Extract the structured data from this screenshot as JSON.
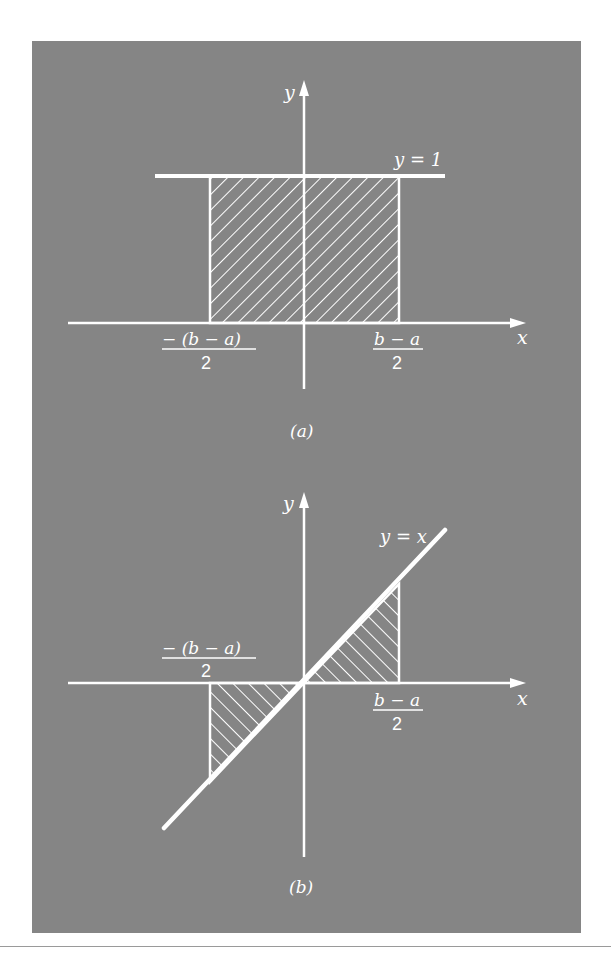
{
  "figure": {
    "background_color": "#858585",
    "line_color": "#ffffff",
    "panels": [
      {
        "id": "a",
        "caption": "(a)",
        "y_axis_label": "y",
        "x_axis_label": "x",
        "curve_label": "y = 1",
        "left_tick": {
          "numerator": "− (b − a)",
          "denominator": "2"
        },
        "right_tick": {
          "numerator": "b − a",
          "denominator": "2"
        },
        "shaded_region": "rectangle from -(b-a)/2 to (b-a)/2 under y = 1"
      },
      {
        "id": "b",
        "caption": "(b)",
        "y_axis_label": "y",
        "x_axis_label": "x",
        "curve_label": "y = x",
        "left_tick": {
          "numerator": "− (b − a)",
          "denominator": "2"
        },
        "right_tick": {
          "numerator": "b − a",
          "denominator": "2"
        },
        "shaded_region": "two triangles between y = x and x-axis on [-(b-a)/2, (b-a)/2]"
      }
    ]
  }
}
